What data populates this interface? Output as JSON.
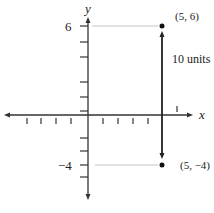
{
  "axes": {
    "x_label": "x",
    "y_label": "y",
    "y_tick_label_top": "6",
    "y_tick_label_bottom": "−4",
    "axis_color": "#333333",
    "guide_color": "#bbbbbb"
  },
  "points": [
    {
      "label": "(5, 6)",
      "x": 5,
      "y": 6
    },
    {
      "label": "(5, −4)",
      "x": 5,
      "y": -4
    }
  ],
  "segment": {
    "label": "10 units",
    "from": [
      5,
      -4
    ],
    "to": [
      5,
      6
    ],
    "color": "#222222"
  }
}
